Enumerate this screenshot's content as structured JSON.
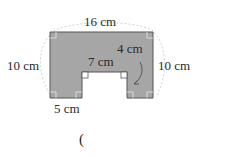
{
  "figure": {
    "labels": {
      "top": "16 cm",
      "left": "10 cm",
      "right": "10 cm",
      "inner_top": "7 cm",
      "notch_depth": "4 cm",
      "bottom_left": "5 cm"
    },
    "answer_paren": "(",
    "colors": {
      "fill": "#a6a6a6",
      "stroke": "#555555",
      "dash": "#bbbbbb",
      "background": "#ffffff"
    }
  }
}
